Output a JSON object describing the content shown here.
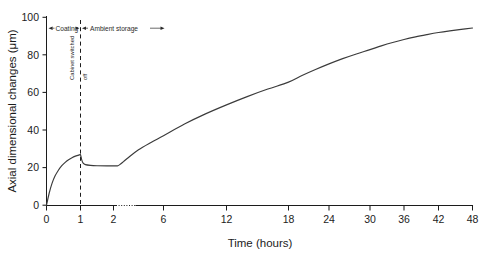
{
  "chart_data": {
    "type": "line",
    "title": "",
    "xlabel": "Time (hours)",
    "ylabel": "Axial dimensional changes (μm)",
    "xlim": [
      0,
      48
    ],
    "ylim": [
      0,
      100
    ],
    "grid": false,
    "legend": "none",
    "x_ticks": [
      "0",
      "1",
      "2",
      "6",
      "12",
      "18",
      "24",
      "30",
      "36",
      "42",
      "48"
    ],
    "x_tick_values": [
      0,
      1,
      2,
      6,
      12,
      18,
      24,
      30,
      36,
      42,
      48
    ],
    "y_ticks": [
      "0",
      "20",
      "40",
      "60",
      "80",
      "100"
    ],
    "y_tick_values": [
      0,
      20,
      40,
      60,
      80,
      100
    ],
    "axis_break": {
      "after": 2,
      "before": 6,
      "style": "dotted"
    },
    "series": [
      {
        "name": "Axial dimensional change",
        "x": [
          0,
          0.08,
          0.16,
          0.25,
          0.35,
          0.45,
          0.55,
          0.65,
          0.75,
          0.85,
          0.92,
          0.97,
          1.0,
          1.04,
          1.08,
          1.15,
          1.3,
          1.5,
          1.8,
          2.0,
          2.2,
          2.35,
          2.5,
          2.8,
          3.2,
          4,
          5,
          6,
          8,
          10,
          12,
          14,
          16,
          18,
          20,
          22,
          24,
          26,
          28,
          30,
          32,
          34,
          36,
          38,
          40,
          42,
          44,
          46,
          48
        ],
        "y": [
          0,
          6.5,
          11.5,
          15.5,
          18.6,
          21.0,
          22.8,
          24.2,
          25.3,
          26.1,
          26.5,
          26.8,
          26.9,
          24.0,
          22.4,
          21.6,
          21.2,
          21.0,
          20.9,
          20.9,
          20.9,
          21.0,
          21.6,
          23.2,
          25.4,
          29.5,
          33.4,
          37.0,
          43.2,
          48.6,
          53.4,
          57.8,
          61.8,
          65.5,
          69.0,
          72.2,
          75.2,
          78.0,
          80.5,
          82.8,
          84.8,
          86.6,
          88.2,
          89.6,
          90.8,
          91.9,
          92.8,
          93.6,
          94.3
        ]
      }
    ],
    "annotations": [
      {
        "id": "event-line",
        "type": "vline",
        "x": 1,
        "label": "Cabinet switched off",
        "style": "dashed"
      },
      {
        "id": "phase-coating",
        "type": "span-label",
        "text": "Coating",
        "from": 0,
        "to": 1
      },
      {
        "id": "phase-ambient",
        "type": "span-label",
        "text": "Ambient storage",
        "from": 1,
        "to": 48
      },
      {
        "id": "event-label-line1",
        "type": "vtext",
        "text": "Cabinet switched"
      },
      {
        "id": "event-label-line2",
        "type": "vtext",
        "text": "off"
      }
    ]
  },
  "axes": {
    "y_title": "Axial dimensional changes (μm)",
    "x_title": "Time (hours)",
    "y_tick_labels": [
      "100",
      "80",
      "60",
      "40",
      "20",
      "0"
    ],
    "x_tick_labels": [
      "0",
      "1",
      "2",
      "6",
      "12",
      "18",
      "24",
      "30",
      "36",
      "42",
      "48"
    ]
  },
  "annotations": {
    "coating": "Coating",
    "ambient_storage": "Ambient storage",
    "cabinet_switched": "Cabinet switched",
    "off": "off"
  },
  "colors": {
    "background": "#ffffff",
    "axis": "#1c1c1c",
    "curve": "#3b3b3b",
    "annotation": "#2a2a2a"
  }
}
